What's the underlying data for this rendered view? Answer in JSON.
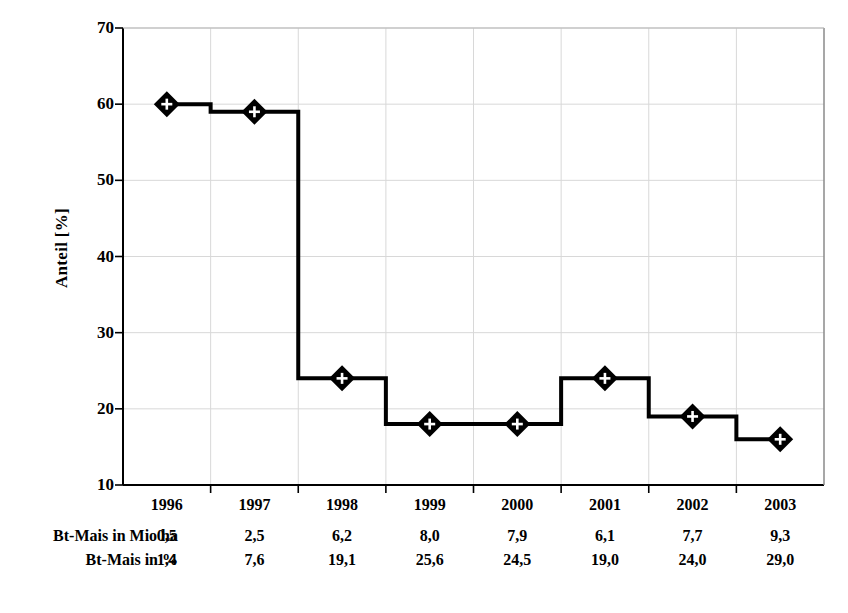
{
  "chart_data": {
    "type": "line",
    "title": "",
    "subtitle": "",
    "xlabel": "",
    "ylabel": "Anteil [%]",
    "categories": [
      "1996",
      "1997",
      "1998",
      "1999",
      "2000",
      "2001",
      "2002",
      "2003"
    ],
    "series": [
      {
        "name": "Anteil [%]",
        "values": [
          60,
          59,
          24,
          18,
          18,
          24,
          19,
          16
        ],
        "marker": "diamond-with-plus",
        "line_style": "step",
        "color": "#000000"
      }
    ],
    "ylim": [
      10,
      70
    ],
    "y_ticks": [
      70,
      60,
      50,
      40,
      30,
      20,
      10
    ],
    "y_tick_labels": [
      "70",
      "60",
      "50",
      "40",
      "30",
      "20",
      "10"
    ],
    "grid": true,
    "grid_color": "#d8d8d8",
    "legend": "none",
    "axis_color": "#000000"
  },
  "table": {
    "column_headers": [
      "1996",
      "1997",
      "1998",
      "1999",
      "2000",
      "2001",
      "2002",
      "2003"
    ],
    "rows": [
      {
        "label": "Bt-Mais in Mio ha",
        "values": [
          "0,5",
          "2,5",
          "6,2",
          "8,0",
          "7,9",
          "6,1",
          "7,7",
          "9,3"
        ]
      },
      {
        "label": "Bt-Mais in %",
        "values": [
          "1,4",
          "7,6",
          "19,1",
          "25,6",
          "24,5",
          "19,0",
          "24,0",
          "29,0"
        ]
      }
    ]
  }
}
